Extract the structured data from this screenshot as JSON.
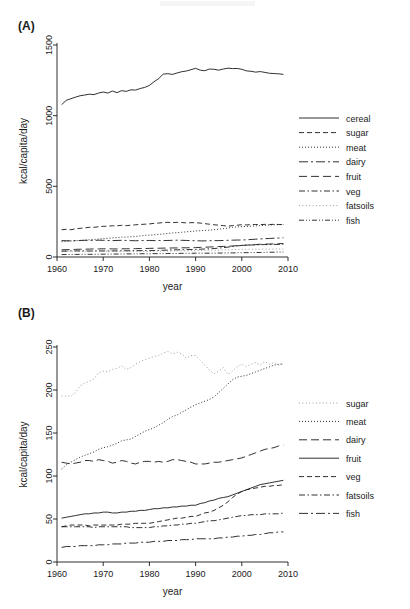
{
  "figure": {
    "panel_a_label": "(A)",
    "panel_b_label": "(B)"
  },
  "chart_data": [
    {
      "id": "panel-a",
      "type": "line",
      "title": "",
      "xlabel": "year",
      "ylabel": "kcal/capita/day",
      "xlim": [
        1960,
        2010
      ],
      "ylim": [
        0,
        1500
      ],
      "xticks": [
        1960,
        1970,
        1980,
        1990,
        2000,
        2010
      ],
      "yticks": [
        0,
        500,
        1000,
        1500
      ],
      "grid": false,
      "legend_position": "right",
      "x": [
        1961,
        1962,
        1963,
        1964,
        1965,
        1966,
        1967,
        1968,
        1969,
        1970,
        1971,
        1972,
        1973,
        1974,
        1975,
        1976,
        1977,
        1978,
        1979,
        1980,
        1981,
        1982,
        1983,
        1984,
        1985,
        1986,
        1987,
        1988,
        1989,
        1990,
        1991,
        1992,
        1993,
        1994,
        1995,
        1996,
        1997,
        1998,
        1999,
        2000,
        2001,
        2002,
        2003,
        2004,
        2005,
        2006,
        2007,
        2008,
        2009
      ],
      "series": [
        {
          "name": "cereal",
          "dash": "solid",
          "values": [
            1078,
            1108,
            1120,
            1131,
            1141,
            1146,
            1152,
            1149,
            1160,
            1167,
            1160,
            1174,
            1163,
            1177,
            1172,
            1183,
            1181,
            1192,
            1200,
            1214,
            1240,
            1262,
            1294,
            1297,
            1292,
            1302,
            1311,
            1316,
            1325,
            1335,
            1322,
            1318,
            1330,
            1328,
            1322,
            1330,
            1336,
            1333,
            1334,
            1328,
            1317,
            1314,
            1308,
            1312,
            1306,
            1300,
            1298,
            1296,
            1292
          ]
        },
        {
          "name": "sugar",
          "dash": "dash",
          "values": [
            193,
            196,
            193,
            199,
            203,
            206,
            210,
            210,
            214,
            217,
            218,
            221,
            221,
            224,
            222,
            225,
            228,
            230,
            232,
            234,
            238,
            240,
            244,
            245,
            243,
            245,
            244,
            241,
            243,
            243,
            240,
            236,
            232,
            228,
            225,
            222,
            218,
            222,
            225,
            228,
            227,
            229,
            230,
            229,
            231,
            230,
            231,
            230,
            230
          ]
        },
        {
          "name": "meat",
          "dash": "dot",
          "values": [
            108,
            111,
            113,
            115,
            117,
            119,
            122,
            124,
            127,
            130,
            132,
            135,
            137,
            140,
            141,
            143,
            146,
            149,
            153,
            155,
            157,
            160,
            163,
            167,
            170,
            172,
            175,
            178,
            181,
            184,
            186,
            188,
            190,
            193,
            197,
            201,
            205,
            210,
            213,
            215,
            216,
            218,
            220,
            222,
            224,
            226,
            228,
            229,
            230
          ]
        },
        {
          "name": "dairy",
          "dash": "dashdot-long",
          "values": [
            116,
            115,
            115,
            116,
            117,
            118,
            118,
            117,
            119,
            118,
            117,
            116,
            117,
            118,
            117,
            116,
            115,
            116,
            117,
            117,
            116,
            117,
            116,
            117,
            118,
            119,
            118,
            117,
            116,
            115,
            114,
            114,
            115,
            116,
            116,
            117,
            118,
            119,
            120,
            120,
            122,
            124,
            126,
            128,
            130,
            131,
            133,
            134,
            136
          ]
        },
        {
          "name": "fruit",
          "dash": "longdash",
          "values": [
            51,
            52,
            53,
            54,
            55,
            55,
            56,
            57,
            57,
            58,
            58,
            57,
            57,
            58,
            58,
            59,
            59,
            60,
            60,
            61,
            62,
            62,
            63,
            63,
            64,
            64,
            65,
            65,
            66,
            66,
            68,
            69,
            71,
            72,
            74,
            75,
            76,
            78,
            80,
            82,
            84,
            86,
            88,
            90,
            91,
            92,
            93,
            94,
            95
          ]
        },
        {
          "name": "veg",
          "dash": "dashdot",
          "values": [
            41,
            42,
            43,
            43,
            43,
            43,
            42,
            43,
            43,
            43,
            43,
            43,
            43,
            44,
            44,
            44,
            45,
            45,
            45,
            45,
            46,
            47,
            48,
            49,
            50,
            51,
            51,
            52,
            53,
            53,
            55,
            57,
            58,
            60,
            63,
            66,
            70,
            75,
            79,
            82,
            84,
            85,
            86,
            87,
            88,
            88,
            89,
            89,
            90
          ]
        },
        {
          "name": "fatsoils",
          "dash": "finedot",
          "values": [
            41,
            41,
            41,
            41,
            41,
            41,
            41,
            40,
            41,
            41,
            41,
            41,
            41,
            41,
            41,
            40,
            40,
            40,
            40,
            40,
            41,
            41,
            42,
            42,
            43,
            43,
            44,
            44,
            45,
            45,
            46,
            47,
            48,
            48,
            49,
            50,
            51,
            52,
            53,
            54,
            54,
            55,
            55,
            55,
            56,
            56,
            56,
            56,
            57
          ]
        },
        {
          "name": "fish",
          "dash": "dashdotdot",
          "values": [
            17,
            18,
            18,
            18,
            19,
            19,
            19,
            19,
            20,
            20,
            20,
            21,
            21,
            21,
            22,
            22,
            22,
            23,
            23,
            23,
            24,
            24,
            24,
            25,
            25,
            25,
            26,
            26,
            26,
            27,
            27,
            27,
            27,
            27,
            28,
            28,
            29,
            29,
            30,
            30,
            31,
            31,
            32,
            32,
            33,
            34,
            34,
            35,
            35
          ]
        }
      ]
    },
    {
      "id": "panel-b",
      "type": "line",
      "title": "",
      "xlabel": "year",
      "ylabel": "kcal/capita/day",
      "xlim": [
        1960,
        2010
      ],
      "ylim": [
        0,
        250
      ],
      "xticks": [
        1960,
        1970,
        1980,
        1990,
        2000,
        2010
      ],
      "yticks": [
        0,
        50,
        100,
        150,
        200,
        250
      ],
      "grid": false,
      "legend_position": "right",
      "x": [
        1961,
        1962,
        1963,
        1964,
        1965,
        1966,
        1967,
        1968,
        1969,
        1970,
        1971,
        1972,
        1973,
        1974,
        1975,
        1976,
        1977,
        1978,
        1979,
        1980,
        1981,
        1982,
        1983,
        1984,
        1985,
        1986,
        1987,
        1988,
        1989,
        1990,
        1991,
        1992,
        1993,
        1994,
        1995,
        1996,
        1997,
        1998,
        1999,
        2000,
        2001,
        2002,
        2003,
        2004,
        2005,
        2006,
        2007,
        2008,
        2009
      ],
      "series": [
        {
          "name": "sugar",
          "dash": "finedot",
          "values": [
            193,
            193,
            193,
            197,
            205,
            208,
            210,
            213,
            220,
            222,
            221,
            224,
            225,
            228,
            224,
            226,
            230,
            233,
            235,
            237,
            239,
            240,
            243,
            245,
            242,
            244,
            242,
            237,
            240,
            240,
            235,
            229,
            223,
            219,
            222,
            226,
            218,
            222,
            227,
            230,
            227,
            230,
            232,
            229,
            233,
            230,
            232,
            229,
            231
          ]
        },
        {
          "name": "meat",
          "dash": "dot",
          "values": [
            108,
            113,
            116,
            119,
            122,
            124,
            126,
            128,
            131,
            133,
            134,
            136,
            138,
            141,
            142,
            143,
            146,
            149,
            152,
            154,
            156,
            159,
            162,
            166,
            169,
            171,
            174,
            177,
            180,
            183,
            185,
            187,
            189,
            192,
            197,
            202,
            207,
            212,
            215,
            216,
            217,
            219,
            221,
            223,
            225,
            227,
            229,
            230,
            230
          ]
        },
        {
          "name": "dairy",
          "dash": "longdash",
          "values": [
            116,
            115,
            114,
            115,
            116,
            118,
            118,
            117,
            119,
            118,
            117,
            115,
            116,
            118,
            117,
            115,
            114,
            116,
            117,
            117,
            116,
            117,
            116,
            117,
            119,
            119,
            118,
            117,
            116,
            114,
            114,
            114,
            115,
            116,
            116,
            117,
            118,
            119,
            120,
            121,
            123,
            125,
            127,
            129,
            131,
            132,
            133,
            135,
            136
          ]
        },
        {
          "name": "fruit",
          "dash": "solid",
          "values": [
            51,
            52,
            53,
            54,
            55,
            56,
            56,
            57,
            57,
            58,
            58,
            57,
            57,
            58,
            58,
            59,
            59,
            60,
            60,
            61,
            62,
            62,
            63,
            63,
            64,
            64,
            65,
            65,
            66,
            66,
            68,
            69,
            71,
            72,
            74,
            75,
            76,
            78,
            80,
            82,
            84,
            86,
            88,
            90,
            91,
            92,
            93,
            94,
            95
          ]
        },
        {
          "name": "veg",
          "dash": "dash",
          "values": [
            41,
            42,
            43,
            43,
            43,
            43,
            42,
            43,
            43,
            43,
            43,
            43,
            43,
            44,
            44,
            44,
            45,
            45,
            45,
            45,
            46,
            47,
            48,
            49,
            50,
            51,
            51,
            52,
            53,
            53,
            55,
            57,
            58,
            60,
            63,
            66,
            70,
            75,
            79,
            82,
            84,
            85,
            86,
            87,
            88,
            88,
            89,
            89,
            90
          ]
        },
        {
          "name": "fatsoils",
          "dash": "dashdot",
          "values": [
            41,
            41,
            41,
            41,
            41,
            41,
            41,
            40,
            41,
            41,
            41,
            41,
            41,
            41,
            41,
            40,
            40,
            40,
            40,
            40,
            41,
            41,
            42,
            42,
            43,
            43,
            44,
            44,
            45,
            45,
            46,
            47,
            48,
            48,
            49,
            50,
            51,
            52,
            53,
            54,
            54,
            55,
            55,
            55,
            56,
            56,
            56,
            56,
            57
          ]
        },
        {
          "name": "fish",
          "dash": "dashdot-long",
          "values": [
            17,
            18,
            18,
            18,
            19,
            19,
            19,
            19,
            20,
            20,
            20,
            21,
            21,
            21,
            22,
            22,
            22,
            23,
            23,
            23,
            24,
            24,
            24,
            25,
            25,
            25,
            26,
            26,
            26,
            27,
            27,
            27,
            27,
            27,
            28,
            28,
            29,
            29,
            30,
            30,
            31,
            31,
            32,
            32,
            33,
            34,
            34,
            35,
            35
          ]
        }
      ]
    }
  ]
}
